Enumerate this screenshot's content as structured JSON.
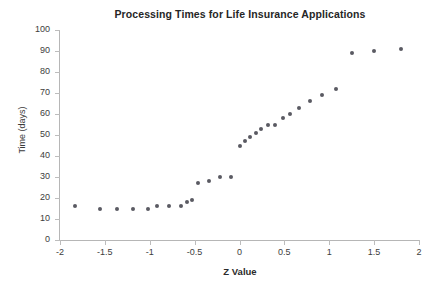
{
  "chart_data": {
    "type": "scatter",
    "title": "Processing Times for Life Insurance Applications",
    "xlabel": "Z Value",
    "ylabel": "Time (days)",
    "xlim": [
      -2,
      2
    ],
    "ylim": [
      0,
      100
    ],
    "xticks": [
      "-2",
      "-1.5",
      "-1",
      "-0.5",
      "0",
      "0.5",
      "1",
      "1.5",
      "2"
    ],
    "xtick_values": [
      -2,
      -1.5,
      -1,
      -0.5,
      0,
      0.5,
      1,
      1.5,
      2
    ],
    "yticks": [
      "0",
      "10",
      "20",
      "30",
      "40",
      "50",
      "60",
      "70",
      "80",
      "90",
      "100"
    ],
    "ytick_values": [
      0,
      10,
      20,
      30,
      40,
      50,
      60,
      70,
      80,
      90,
      100
    ],
    "grid": false,
    "legend": "none",
    "marker_color": "#5a5a62",
    "series": [
      {
        "name": "Processing time",
        "points": [
          [
            -1.83,
            16
          ],
          [
            -1.55,
            15
          ],
          [
            -1.36,
            15
          ],
          [
            -1.19,
            15
          ],
          [
            -1.02,
            15
          ],
          [
            -0.92,
            16
          ],
          [
            -0.78,
            16
          ],
          [
            -0.65,
            16
          ],
          [
            -0.59,
            18
          ],
          [
            -0.53,
            19
          ],
          [
            -0.46,
            27
          ],
          [
            -0.34,
            28
          ],
          [
            -0.22,
            30
          ],
          [
            -0.1,
            30
          ],
          [
            0.0,
            45
          ],
          [
            0.06,
            47
          ],
          [
            0.12,
            49
          ],
          [
            0.18,
            51
          ],
          [
            0.24,
            53
          ],
          [
            0.32,
            55
          ],
          [
            0.4,
            55
          ],
          [
            0.48,
            58
          ],
          [
            0.56,
            60
          ],
          [
            0.66,
            63
          ],
          [
            0.78,
            66
          ],
          [
            0.92,
            69
          ],
          [
            1.08,
            72
          ],
          [
            1.25,
            89
          ],
          [
            1.5,
            90
          ],
          [
            1.8,
            91
          ]
        ]
      }
    ]
  }
}
